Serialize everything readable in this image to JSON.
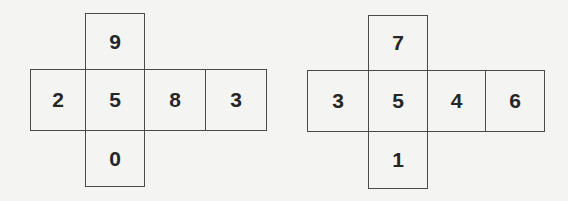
{
  "colors": {
    "background": "#f4f4f2",
    "line": "#4a4a4a",
    "text": "#262626"
  },
  "nets": [
    {
      "name": "left-cube-net",
      "cells": [
        {
          "position": "top",
          "label": "9",
          "x": 85,
          "y": 13,
          "w": 60,
          "h": 57
        },
        {
          "position": "middle-1",
          "label": "2",
          "x": 30,
          "y": 69,
          "w": 56,
          "h": 62
        },
        {
          "position": "middle-2",
          "label": "5",
          "x": 85,
          "y": 69,
          "w": 60,
          "h": 62
        },
        {
          "position": "middle-3",
          "label": "8",
          "x": 144,
          "y": 69,
          "w": 62,
          "h": 62
        },
        {
          "position": "middle-4",
          "label": "3",
          "x": 205,
          "y": 69,
          "w": 62,
          "h": 62
        },
        {
          "position": "bottom",
          "label": "0",
          "x": 85,
          "y": 130,
          "w": 60,
          "h": 57
        }
      ]
    },
    {
      "name": "right-cube-net",
      "cells": [
        {
          "position": "top",
          "label": "7",
          "x": 368,
          "y": 15,
          "w": 60,
          "h": 56
        },
        {
          "position": "middle-1",
          "label": "3",
          "x": 307,
          "y": 70,
          "w": 62,
          "h": 62
        },
        {
          "position": "middle-2",
          "label": "5",
          "x": 368,
          "y": 70,
          "w": 60,
          "h": 62
        },
        {
          "position": "middle-3",
          "label": "4",
          "x": 427,
          "y": 70,
          "w": 59,
          "h": 62
        },
        {
          "position": "middle-4",
          "label": "6",
          "x": 485,
          "y": 70,
          "w": 60,
          "h": 62
        },
        {
          "position": "bottom",
          "label": "1",
          "x": 368,
          "y": 131,
          "w": 60,
          "h": 58
        }
      ]
    }
  ]
}
